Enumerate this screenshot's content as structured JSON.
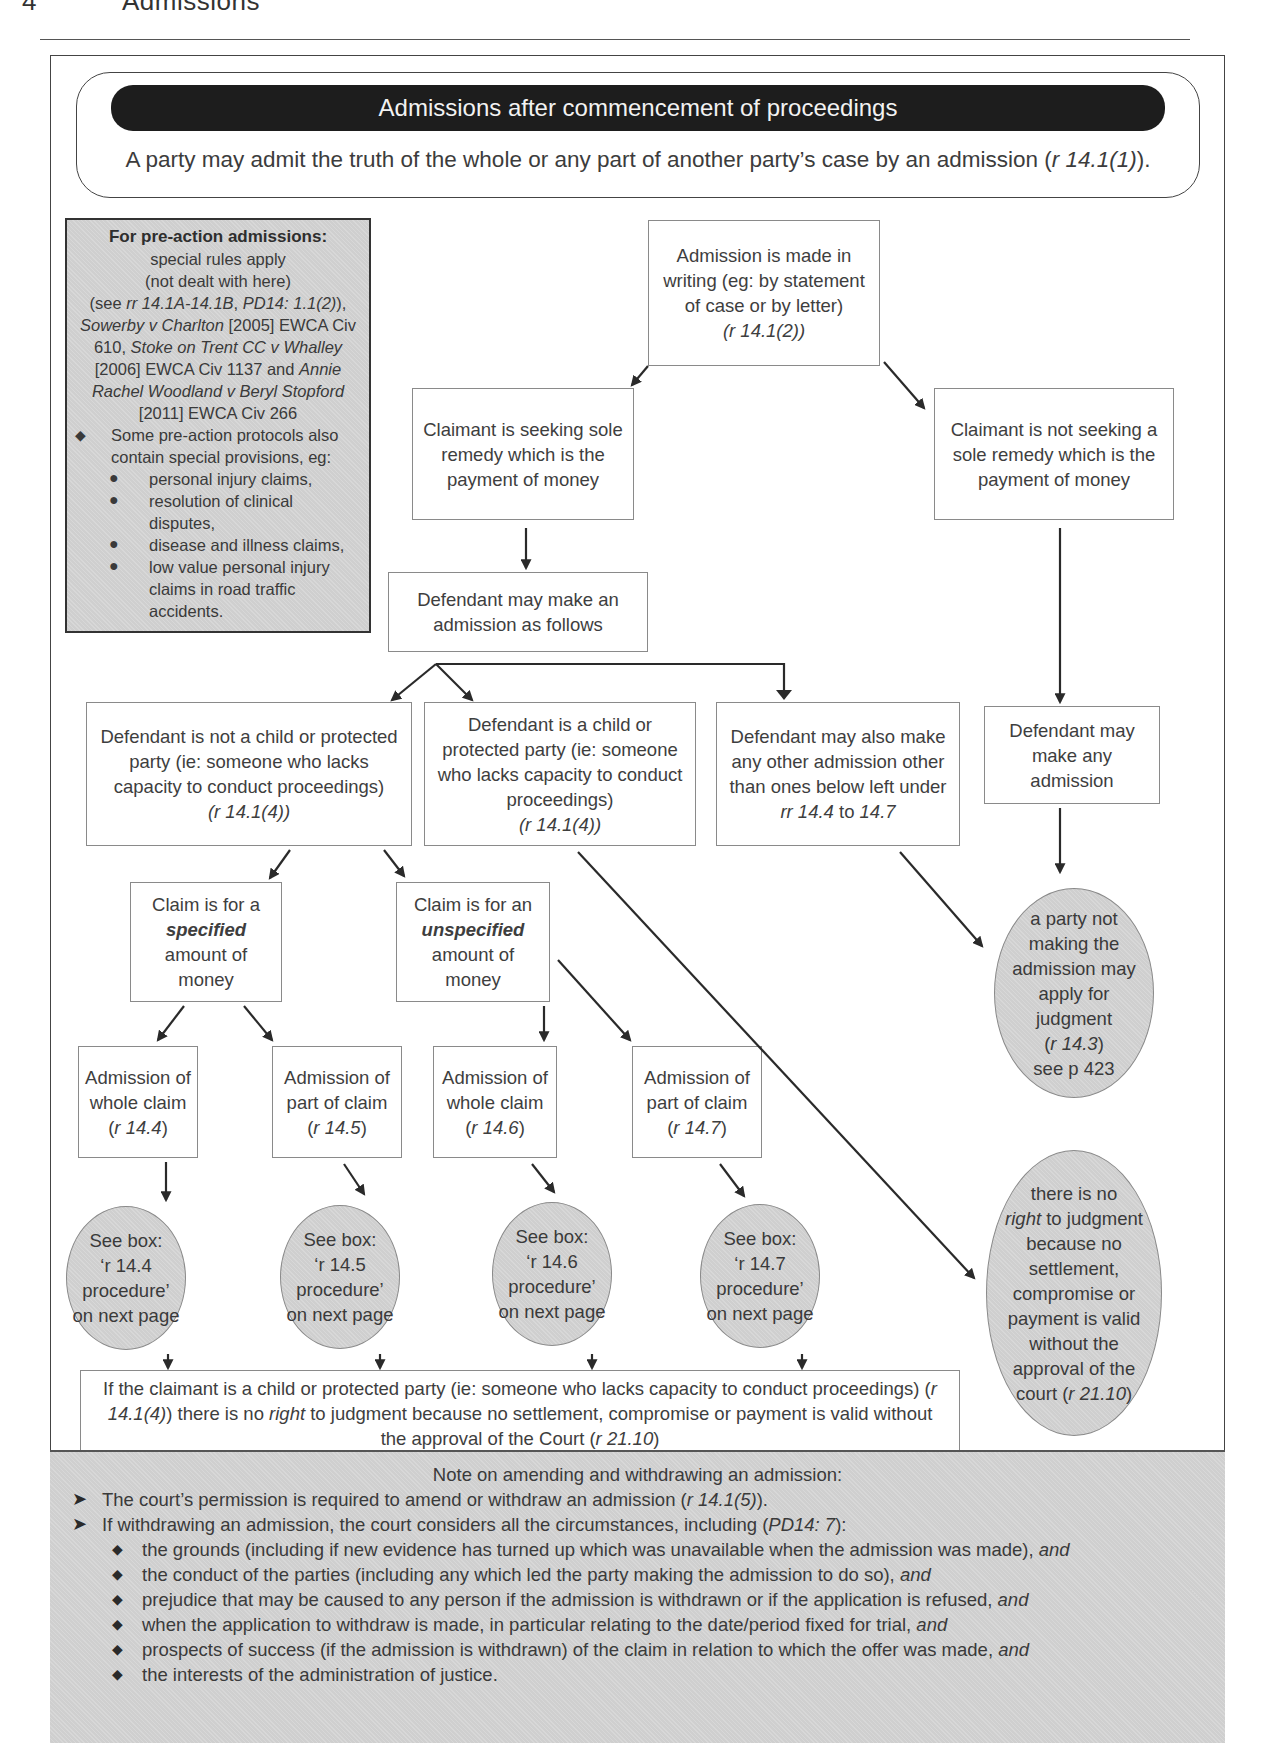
{
  "running_head": {
    "page_number": "4",
    "title": "Admissions"
  },
  "intro": {
    "title": "Admissions after commencement of proceedings",
    "text_pre": "A party may admit the truth of the whole or any part of another party’s case by an admission (",
    "text_ref": "r 14.1(1)",
    "text_post": ")."
  },
  "pre_action": {
    "heading": "For pre-action admissions:",
    "line1": "special rules apply",
    "line2": "(not dealt with here)",
    "see_pre": "(see ",
    "see_ref1": "rr 14.1A-14.1B",
    "see_sep": ", ",
    "see_ref2": "PD14: 1.1(2)",
    "see_post": "),",
    "case1_name": "Sowerby v Charlton",
    "case1_cite": " [2005] EWCA Civ 610, ",
    "case2_name": "Stoke on Trent CC v Whalley",
    "case2_cite": " [2006] EWCA Civ 1137 and ",
    "case3_name": "Annie Rachel Woodland v Beryl Stopford",
    "case3_cite": " [2011] EWCA Civ 266",
    "bullet_diamond": "◆",
    "bullet_dot": "●",
    "protocols_intro": "Some pre-action protocols also contain special provisions, eg:",
    "protocols": [
      "personal injury claims,",
      "resolution of clinical disputes,",
      "disease and illness claims,",
      "low value personal injury claims in road traffic accidents."
    ]
  },
  "flow": {
    "admission_writing": {
      "text": "Admission is made in writing (eg: by statement of case or by letter)",
      "ref": "(r 14.1(2))"
    },
    "claimant_money": "Claimant is seeking sole remedy which is the payment of money",
    "claimant_not_money": "Claimant is not seeking a sole remedy which is the payment of money",
    "defendant_may_admit": "Defendant may make an admission as follows",
    "defendant_not_child": {
      "text": "Defendant is not a child or protected party (ie: someone who lacks capacity to conduct proceedings)",
      "ref": "(r 14.1(4))"
    },
    "defendant_child": {
      "text": "Defendant is a child or protected party (ie: someone who lacks capacity to conduct proceedings)",
      "ref": "(r 14.1(4))"
    },
    "defendant_other": {
      "text": "Defendant may also make any other admission other than ones below left under",
      "ref_a": "rr 14.4",
      "ref_mid": " to ",
      "ref_b": "14.7"
    },
    "defendant_any": "Defendant may make any admission",
    "claim_specified": {
      "pre": "Claim is for a",
      "emph": "specified",
      "post": "amount of money"
    },
    "claim_unspecified": {
      "pre": "Claim is for an",
      "emph": "unspecified",
      "post": "amount of money"
    },
    "admissions": [
      {
        "text": "Admission of whole claim",
        "ref": "r 14.4"
      },
      {
        "text": "Admission of part of claim",
        "ref": "r 14.5"
      },
      {
        "text": "Admission of whole claim",
        "ref": "r 14.6"
      },
      {
        "text": "Admission of part of claim",
        "ref": "r 14.7"
      }
    ],
    "see_boxes": [
      {
        "line1": "See box:",
        "line2": "‘r 14.4 procedure’",
        "line3": "on next page"
      },
      {
        "line1": "See box:",
        "line2": "‘r 14.5 procedure’",
        "line3": "on next page"
      },
      {
        "line1": "See box:",
        "line2": "‘r 14.6 procedure’",
        "line3": "on next page"
      },
      {
        "line1": "See box:",
        "line2": "‘r 14.7 procedure’",
        "line3": "on next page"
      }
    ],
    "party_may_apply": {
      "text": "a party not making the admission may apply for judgment",
      "ref": "r 14.3",
      "page": "see p 423"
    },
    "no_right_ellipse": {
      "pre": "there is no",
      "emph": "right",
      "mid": "to judgment because no settlement, compromise or payment is valid without the approval of the court (",
      "ref": "r 21.10",
      "post": ")"
    },
    "claimant_child": {
      "a": "If the claimant is a child or protected party (ie: someone who lacks capacity to conduct proceedings) (",
      "ref1": "r 14.1(4)",
      "b": ") there is no ",
      "emph": "right",
      "c": " to judgment because no settlement, compromise or payment is valid without the approval of the Court (",
      "ref2": "r 21.10",
      "d": ")"
    }
  },
  "note": {
    "title": "Note on amending and withdrawing an admission:",
    "arrow_bullet": "➤",
    "diamond_bullet": "◆",
    "point1_pre": "The court’s permission is required to amend or withdraw an admission (",
    "point1_ref": "r 14.1(5)",
    "point1_post": ").",
    "point2_pre": "If withdrawing an admission, the court considers all the circumstances, including (",
    "point2_ref": "PD14: 7",
    "point2_post": "):",
    "and": "and",
    "factors": [
      "the grounds (including if new evidence has turned up which was unavailable when the admission was made), ",
      "the conduct of the parties (including any which led the party making the admission to do so), ",
      "prejudice that may be caused to any person if the admission is withdrawn or if the application is refused, ",
      "when the application to withdraw is made, in particular relating to the date/period fixed for trial, ",
      "prospects of success (if the admission is withdrawn) of the claim in relation to which the offer was made, "
    ],
    "last_factor": "the interests of the administration of justice."
  }
}
